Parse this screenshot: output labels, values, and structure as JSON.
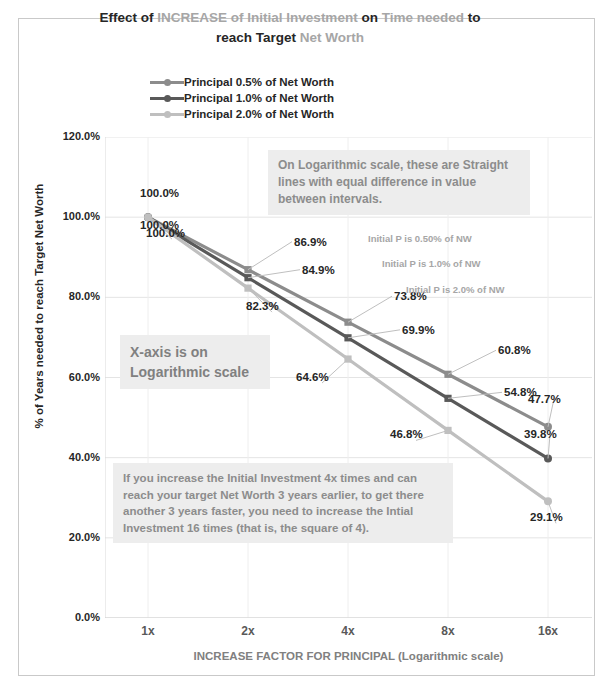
{
  "title": {
    "line1_a": "Effect of ",
    "line1_b": "INCREASE",
    "line1_c": " of Initial Investment ",
    "line1_d": "on ",
    "line1_e": "Time needed ",
    "line1_f": "to",
    "line2_a": "reach Target ",
    "line2_b": "Net Worth"
  },
  "legend": [
    {
      "label": "Principal 0.5% of Net Worth",
      "color": "#8c8c8c"
    },
    {
      "label": "Principal 1.0% of Net Worth",
      "color": "#595959"
    },
    {
      "label": "Principal 2.0% of Net Worth",
      "color": "#bfbfbf"
    }
  ],
  "notes": {
    "log_scale": "On Logarithmic scale, these are Straight lines with  equal difference in value between intervals.",
    "x_axis_log": "X-axis is on Logarithmic scale",
    "explanation": "If you increase the Initial Investment 4x times and can reach your target Net Worth 3 years earlier, to get there another 3 years faster, you need to increase the Intial Investment 16 times (that is, the square of 4)."
  },
  "series_annotations": [
    "Initial P is 0.50% of NW",
    "Initial P is 1.0% of NW",
    "Initial P is 2.0% of NW"
  ],
  "chart_data": {
    "type": "line",
    "title": "Effect of INCREASE of Initial Investment on Time needed to reach Target Net Worth",
    "xlabel": "INCREASE FACTOR FOR PRINCIPAL (Logarithmic scale)",
    "ylabel": "% of Years needed to reach Target Net Worth",
    "xscale": "log",
    "categories": [
      "1x",
      "2x",
      "4x",
      "8x",
      "16x"
    ],
    "x": [
      1,
      2,
      4,
      8,
      16
    ],
    "ylim": [
      0,
      120
    ],
    "yticks": [
      "0.0%",
      "20.0%",
      "40.0%",
      "60.0%",
      "80.0%",
      "100.0%",
      "120.0%"
    ],
    "ytick_values": [
      0,
      20,
      40,
      60,
      80,
      100,
      120
    ],
    "grid": true,
    "legend_position": "top",
    "series": [
      {
        "name": "Principal 0.5% of Net Worth",
        "color": "#8c8c8c",
        "values": [
          100.0,
          86.9,
          73.8,
          60.8,
          47.7
        ],
        "labels": [
          "100.0%",
          "86.9%",
          "73.8%",
          "60.8%",
          "47.7%"
        ]
      },
      {
        "name": "Principal 1.0% of Net Worth",
        "color": "#595959",
        "values": [
          100.0,
          84.9,
          69.9,
          54.8,
          39.8
        ],
        "labels": [
          "100.0%",
          "84.9%",
          "69.9%",
          "54.8%",
          "39.8%"
        ]
      },
      {
        "name": "Principal 2.0% of Net Worth",
        "color": "#bfbfbf",
        "values": [
          100.0,
          82.3,
          64.6,
          46.8,
          29.1
        ],
        "labels": [
          "100.0%",
          "82.3%",
          "64.6%",
          "46.8%",
          "29.1%"
        ]
      }
    ]
  }
}
